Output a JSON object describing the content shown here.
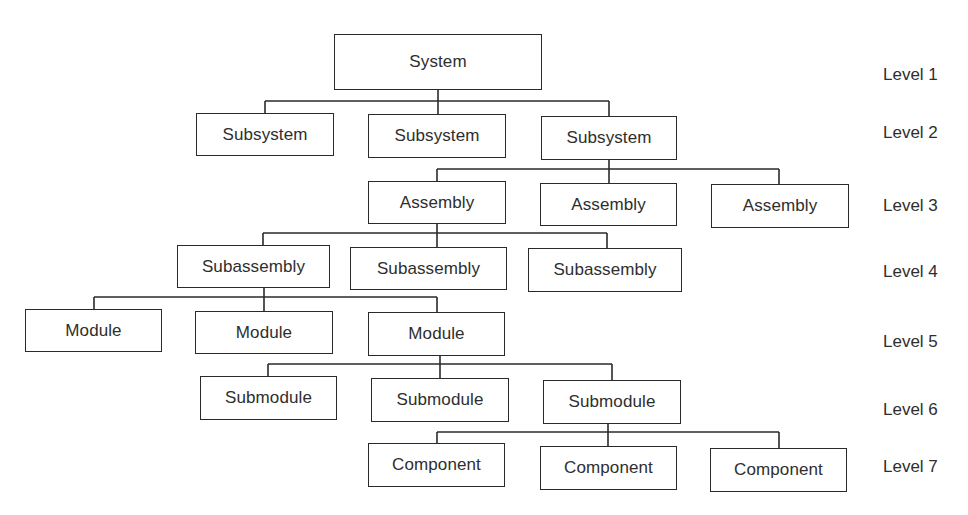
{
  "diagram": {
    "type": "hierarchy-tree",
    "line_color": "#2a2a2a",
    "text_color": "#2e2e2e",
    "levels": [
      {
        "label": "Level 1",
        "y": 75
      },
      {
        "label": "Level 2",
        "y": 133
      },
      {
        "label": "Level 3",
        "y": 206
      },
      {
        "label": "Level 4",
        "y": 272
      },
      {
        "label": "Level 5",
        "y": 342
      },
      {
        "label": "Level 6",
        "y": 410
      },
      {
        "label": "Level 7",
        "y": 467
      }
    ],
    "nodes": [
      {
        "id": "system",
        "label": "System",
        "level": 1,
        "x": 334,
        "y": 34,
        "w": 208,
        "h": 56
      },
      {
        "id": "subsystem-1",
        "label": "Subsystem",
        "level": 2,
        "parent": "system",
        "x": 196,
        "y": 113,
        "w": 138,
        "h": 43
      },
      {
        "id": "subsystem-2",
        "label": "Subsystem",
        "level": 2,
        "parent": "system",
        "x": 368,
        "y": 114,
        "w": 138,
        "h": 44
      },
      {
        "id": "subsystem-3",
        "label": "Subsystem",
        "level": 2,
        "parent": "system",
        "x": 541,
        "y": 116,
        "w": 136,
        "h": 44
      },
      {
        "id": "assembly-1",
        "label": "Assembly",
        "level": 3,
        "parent": "subsystem-3",
        "x": 368,
        "y": 181,
        "w": 138,
        "h": 43
      },
      {
        "id": "assembly-2",
        "label": "Assembly",
        "level": 3,
        "parent": "subsystem-3",
        "x": 540,
        "y": 183,
        "w": 137,
        "h": 43
      },
      {
        "id": "assembly-3",
        "label": "Assembly",
        "level": 3,
        "parent": "subsystem-3",
        "x": 711,
        "y": 184,
        "w": 138,
        "h": 44
      },
      {
        "id": "subassembly-1",
        "label": "Subassembly",
        "level": 4,
        "parent": "assembly-1",
        "x": 177,
        "y": 245,
        "w": 153,
        "h": 43
      },
      {
        "id": "subassembly-2",
        "label": "Subassembly",
        "level": 4,
        "parent": "assembly-1",
        "x": 350,
        "y": 247,
        "w": 157,
        "h": 43
      },
      {
        "id": "subassembly-3",
        "label": "Subassembly",
        "level": 4,
        "parent": "assembly-1",
        "x": 528,
        "y": 248,
        "w": 154,
        "h": 44
      },
      {
        "id": "module-1",
        "label": "Module",
        "level": 5,
        "parent": "subassembly-1",
        "x": 25,
        "y": 309,
        "w": 137,
        "h": 43
      },
      {
        "id": "module-2",
        "label": "Module",
        "level": 5,
        "parent": "subassembly-1",
        "x": 195,
        "y": 311,
        "w": 138,
        "h": 43
      },
      {
        "id": "module-3",
        "label": "Module",
        "level": 5,
        "parent": "subassembly-1",
        "x": 368,
        "y": 312,
        "w": 137,
        "h": 44
      },
      {
        "id": "submodule-1",
        "label": "Submodule",
        "level": 6,
        "parent": "module-3",
        "x": 200,
        "y": 376,
        "w": 137,
        "h": 44
      },
      {
        "id": "submodule-2",
        "label": "Submodule",
        "level": 6,
        "parent": "module-3",
        "x": 371,
        "y": 378,
        "w": 138,
        "h": 44
      },
      {
        "id": "submodule-3",
        "label": "Submodule",
        "level": 6,
        "parent": "module-3",
        "x": 543,
        "y": 380,
        "w": 138,
        "h": 44
      },
      {
        "id": "component-1",
        "label": "Component",
        "level": 7,
        "parent": "submodule-3",
        "x": 368,
        "y": 443,
        "w": 137,
        "h": 44
      },
      {
        "id": "component-2",
        "label": "Component",
        "level": 7,
        "parent": "submodule-3",
        "x": 540,
        "y": 446,
        "w": 137,
        "h": 44
      },
      {
        "id": "component-3",
        "label": "Component",
        "level": 7,
        "parent": "submodule-3",
        "x": 710,
        "y": 448,
        "w": 137,
        "h": 44
      }
    ],
    "connectors": [
      {
        "from": "system",
        "bus_y": 101,
        "parent_x": 438,
        "parent_bottom": 90,
        "children": [
          {
            "x": 265,
            "top": 113
          },
          {
            "x": 438,
            "top": 114
          },
          {
            "x": 609,
            "top": 116
          }
        ]
      },
      {
        "from": "subsystem-3",
        "bus_y": 169,
        "parent_x": 609,
        "parent_bottom": 160,
        "children": [
          {
            "x": 437,
            "top": 181
          },
          {
            "x": 609,
            "top": 183
          },
          {
            "x": 779,
            "top": 184
          }
        ]
      },
      {
        "from": "assembly-1",
        "bus_y": 233,
        "parent_x": 437,
        "parent_bottom": 224,
        "children": [
          {
            "x": 263,
            "top": 245
          },
          {
            "x": 437,
            "top": 247
          },
          {
            "x": 607,
            "top": 248
          }
        ]
      },
      {
        "from": "subassembly-1",
        "bus_y": 297,
        "parent_x": 264,
        "parent_bottom": 288,
        "children": [
          {
            "x": 94,
            "top": 309
          },
          {
            "x": 264,
            "top": 311
          },
          {
            "x": 437,
            "top": 312
          }
        ]
      },
      {
        "from": "module-3",
        "bus_y": 364,
        "parent_x": 440,
        "parent_bottom": 356,
        "children": [
          {
            "x": 268,
            "top": 376
          },
          {
            "x": 440,
            "top": 378
          },
          {
            "x": 612,
            "top": 380
          }
        ]
      },
      {
        "from": "submodule-3",
        "bus_y": 432,
        "parent_x": 608,
        "parent_bottom": 424,
        "children": [
          {
            "x": 437,
            "top": 443
          },
          {
            "x": 608,
            "top": 446
          },
          {
            "x": 779,
            "top": 448
          }
        ]
      }
    ]
  }
}
